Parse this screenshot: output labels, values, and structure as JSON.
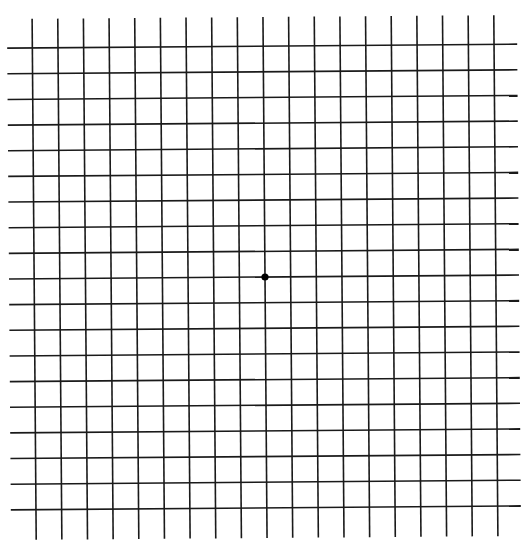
{
  "diagram": {
    "type": "amsler-grid",
    "rows": 18,
    "columns": 18,
    "horizontal_lines": 19,
    "vertical_lines": 19,
    "line_color": "#1a1a1a",
    "background": "#ffffff",
    "center_dot": {
      "present": true,
      "color": "#000000"
    }
  }
}
